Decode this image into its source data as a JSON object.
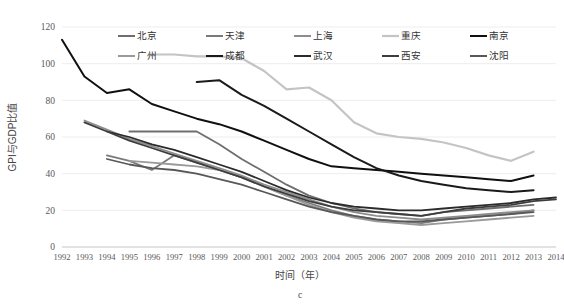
{
  "chart_data": {
    "type": "line",
    "title": "",
    "panel_label": "c",
    "xlabel": "时间（年）",
    "ylabel": "GPI与GDP比值",
    "xlim": [
      1992,
      2014
    ],
    "ylim": [
      0,
      120
    ],
    "ytick_labels": [
      "0",
      "20",
      "40",
      "60",
      "80",
      "100",
      "120"
    ],
    "yticks": [
      0,
      20,
      40,
      60,
      80,
      100,
      120
    ],
    "xtick_labels": [
      "1992",
      "1993",
      "1994",
      "1995",
      "1996",
      "1997",
      "1998",
      "1999",
      "2000",
      "2001",
      "2002",
      "2003",
      "2004",
      "2005",
      "2006",
      "2007",
      "2008",
      "2009",
      "2010",
      "2011",
      "2012",
      "2013",
      "2014"
    ],
    "x": [
      1992,
      1993,
      1994,
      1995,
      1996,
      1997,
      1998,
      1999,
      2000,
      2001,
      2002,
      2003,
      2004,
      2005,
      2006,
      2007,
      2008,
      2009,
      2010,
      2011,
      2012,
      2013,
      2014
    ],
    "grid": "horizontal",
    "legend_position": "top-center",
    "legend_rows": 2,
    "legend_columns": 5,
    "series": [
      {
        "name": "北京",
        "color": "#6e6e6e",
        "width": 1.8,
        "x": [
          1995,
          1996,
          1997,
          1998,
          1999,
          2000,
          2001,
          2002,
          2003,
          2004,
          2005,
          2006,
          2007,
          2008,
          2009,
          2010,
          2011,
          2012,
          2013
        ],
        "values": [
          63,
          63,
          63,
          63,
          56,
          48,
          41,
          34,
          28,
          24,
          21,
          19,
          18,
          17,
          19,
          20,
          21,
          22,
          23
        ]
      },
      {
        "name": "天津",
        "color": "#7a7a7a",
        "width": 1.8,
        "x": [
          1994,
          1995,
          1996,
          1997,
          1998,
          1999,
          2000,
          2001,
          2002,
          2003,
          2004,
          2005,
          2006,
          2007,
          2008,
          2009,
          2010,
          2011,
          2012,
          2013
        ],
        "values": [
          50,
          47,
          42,
          50,
          46,
          42,
          38,
          33,
          28,
          24,
          20,
          17,
          15,
          14,
          13,
          15,
          16,
          17,
          18,
          20
        ]
      },
      {
        "name": "上海",
        "color": "#8d8d8d",
        "width": 1.8,
        "x": [
          1993,
          1994,
          1995,
          1996,
          1997,
          1998,
          1999,
          2000,
          2001,
          2002,
          2003,
          2004,
          2005,
          2006,
          2007,
          2008,
          2009,
          2010,
          2011,
          2012,
          2013
        ],
        "values": [
          69,
          64,
          59,
          55,
          51,
          47,
          43,
          39,
          34,
          30,
          26,
          22,
          19,
          17,
          16,
          15,
          16,
          17,
          18,
          19,
          20
        ]
      },
      {
        "name": "重庆",
        "color": "#c4c4c4",
        "width": 2.2,
        "x": [
          1996,
          1997,
          1998,
          1999,
          2000,
          2001,
          2002,
          2003,
          2004,
          2005,
          2006,
          2007,
          2008,
          2009,
          2010,
          2011,
          2012,
          2013
        ],
        "values": [
          105,
          105,
          104,
          104,
          103,
          96,
          86,
          87,
          80,
          68,
          62,
          60,
          59,
          57,
          54,
          50,
          47,
          52
        ]
      },
      {
        "name": "南京",
        "color": "#101010",
        "width": 2.0,
        "x": [
          1992,
          1993,
          1994,
          1995,
          1996,
          1997,
          1998,
          1999,
          2000,
          2001,
          2002,
          2003,
          2004,
          2005,
          2006,
          2007,
          2008,
          2009,
          2010,
          2011,
          2012,
          2013
        ],
        "values": [
          113,
          93,
          84,
          86,
          78,
          74,
          70,
          67,
          63,
          58,
          53,
          48,
          44,
          43,
          42,
          41,
          40,
          39,
          38,
          37,
          36,
          39
        ]
      },
      {
        "name": "广州",
        "color": "#9a9a9a",
        "width": 1.8,
        "x": [
          1995,
          1996,
          1997,
          1998,
          1999,
          2000,
          2001,
          2002,
          2003,
          2004,
          2005,
          2006,
          2007,
          2008,
          2009,
          2010,
          2011,
          2012,
          2013
        ],
        "values": [
          47,
          46,
          45,
          44,
          42,
          38,
          33,
          28,
          23,
          19,
          16,
          14,
          13,
          12,
          13,
          14,
          15,
          16,
          17
        ]
      },
      {
        "name": "成都",
        "color": "#1a1a1a",
        "width": 2.0,
        "x": [
          1998,
          1999,
          2000,
          2001,
          2002,
          2003,
          2004,
          2005,
          2006,
          2007,
          2008,
          2009,
          2010,
          2011,
          2012,
          2013
        ],
        "values": [
          90,
          91,
          83,
          77,
          70,
          63,
          56,
          49,
          43,
          39,
          36,
          34,
          32,
          31,
          30,
          31
        ]
      },
      {
        "name": "武汉",
        "color": "#2b2b2b",
        "width": 1.8,
        "x": [
          1994,
          1995,
          1996,
          1997,
          1998,
          1999,
          2000,
          2001,
          2002,
          2003,
          2004,
          2005,
          2006,
          2007,
          2008,
          2009,
          2010,
          2011,
          2012,
          2013,
          2014
        ],
        "values": [
          63,
          60,
          56,
          53,
          49,
          45,
          41,
          36,
          31,
          27,
          24,
          22,
          21,
          20,
          20,
          21,
          22,
          23,
          24,
          26,
          27
        ]
      },
      {
        "name": "西安",
        "color": "#3d3d3d",
        "width": 1.8,
        "x": [
          1993,
          1994,
          1995,
          1996,
          1997,
          1998,
          1999,
          2000,
          2001,
          2002,
          2003,
          2004,
          2005,
          2006,
          2007,
          2008,
          2009,
          2010,
          2011,
          2012,
          2013,
          2014
        ],
        "values": [
          68,
          63,
          58,
          54,
          50,
          46,
          42,
          38,
          33,
          29,
          25,
          22,
          20,
          19,
          18,
          17,
          19,
          21,
          22,
          23,
          25,
          26
        ]
      },
      {
        "name": "沈阳",
        "color": "#585858",
        "width": 1.8,
        "x": [
          1994,
          1995,
          1996,
          1997,
          1998,
          1999,
          2000,
          2001,
          2002,
          2003,
          2004,
          2005,
          2006,
          2007,
          2008,
          2009,
          2010,
          2011,
          2012,
          2013
        ],
        "values": [
          48,
          45,
          43,
          42,
          40,
          37,
          34,
          30,
          26,
          22,
          19,
          17,
          15,
          14,
          14,
          15,
          16,
          17,
          18,
          19
        ]
      }
    ]
  }
}
